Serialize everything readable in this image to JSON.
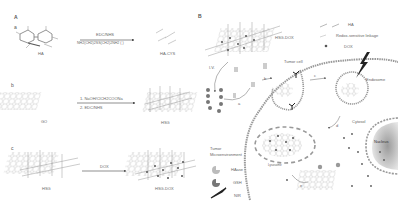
{
  "panel_a": {
    "letter": "A",
    "row_a": {
      "letter": "a",
      "reactant": "HA",
      "reagent_top": "EDC/NHS",
      "reagent_bottom": "NH2(CH2)2SS(CH2)2NH2 ( )",
      "product": "HA-CYS"
    },
    "row_b": {
      "letter": "b",
      "reactant": "GO",
      "step1": "1. NaOH/ClCH2COONa",
      "step2": "2. EDC/NHS",
      "product": "HSG"
    },
    "row_c": {
      "letter": "c",
      "reactant": "HSG",
      "reagent": "DOX",
      "product": "HSG-DOX"
    }
  },
  "panel_b": {
    "letter": "B",
    "nanoparticle_label": "HSG-DOX",
    "legend": [
      {
        "icon": "ha-line-icon",
        "label": "HA"
      },
      {
        "icon": "redox-linkage-icon",
        "label": "Redox-sensitive linkage"
      },
      {
        "icon": "dox-dot-icon",
        "label": "DOX"
      }
    ],
    "route_label": "I.V.",
    "step_labels": [
      "a",
      "b",
      "c",
      "d",
      "e"
    ],
    "tumor_cell_label": "Tumor cell",
    "endosome_label": "Endosome",
    "cytosol_label": "Cytosol",
    "nucleus_label": "Nucleus",
    "lysosome_label": "Lysosome",
    "tumor_env": {
      "title_line1": "Tumor",
      "title_line2": "Microenvironment",
      "items": [
        {
          "icon": "haase-icon",
          "label": "HAase"
        },
        {
          "icon": "gsh-icon",
          "label": "GSH"
        },
        {
          "icon": "nir-icon",
          "label": "NIR"
        }
      ]
    },
    "colors": {
      "line": "#888888",
      "dox": "#555555",
      "membrane": "#9a9a9a",
      "nucleus_fill": "#b0b0b0"
    }
  }
}
